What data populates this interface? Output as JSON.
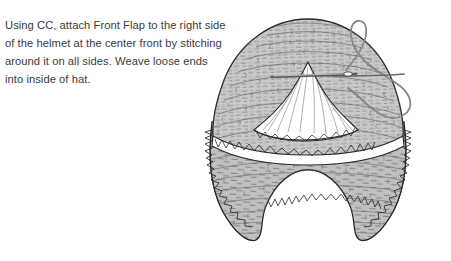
{
  "page": {
    "background_color": "#ffffff",
    "width": 451,
    "height": 261
  },
  "instructions": {
    "text_color": "#3b3b3b",
    "full_text": "Using CC, attach Front Flap to the right side of the helmet at the center front by stitching around it on all sides. Weave loose ends into inside of hat.",
    "lines": [
      "Using CC, attach Front Flap to the right side",
      "of the helmet at the center front by stitching",
      "around it on all sides. Weave loose ends",
      "into inside of hat."
    ]
  },
  "illustration": {
    "name": "crochet-helmet-hat-with-front-flap-diagram",
    "description": "Line drawing of a crocheted helmet hat seen from the front with earflaps, a white triangular front flap stitched at center front, and a threaded yarn needle passing through the flap.",
    "colors": {
      "outline": "#2b2b2b",
      "fabric_fill": "#c9c9c9",
      "fabric_shadow": "#a8a8a8",
      "flap_fill": "#ffffff",
      "needle": "#5a5a5a",
      "thread": "#6b6b6b"
    },
    "parts": [
      {
        "name": "helmet-crown",
        "label": "Helmet crown"
      },
      {
        "name": "front-flap",
        "label": "Front Flap"
      },
      {
        "name": "left-earflap",
        "label": "Left earflap"
      },
      {
        "name": "right-earflap",
        "label": "Right earflap"
      },
      {
        "name": "scalloped-edging",
        "label": "Scalloped crochet edging"
      },
      {
        "name": "yarn-needle",
        "label": "Yarn needle"
      },
      {
        "name": "yarn-thread",
        "label": "Working yarn"
      }
    ]
  }
}
